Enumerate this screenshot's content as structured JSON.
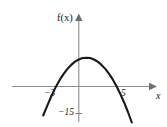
{
  "figure": {
    "background_color": "#ffffff",
    "curve_color": "#1a1a1a",
    "axis_color": "#8d8d8d",
    "text_color": "#161616",
    "width": 167,
    "height": 127
  },
  "labels": {
    "y_axis_label": "f(x)",
    "x_axis_label": "x",
    "tick_left": "−3",
    "tick_right": "5",
    "tick_minimum": "−15"
  },
  "chart_data": {
    "type": "line",
    "title": "",
    "subtitle": "",
    "xlabel": "x",
    "ylabel": "f(x)",
    "grid": false,
    "legend": null,
    "legend_position": "none",
    "axis_arrows": {
      "x_right": true,
      "x_left": false,
      "y_top": true,
      "y_bottom": false
    },
    "xlim": [
      -6.2,
      8.4
    ],
    "ylim": [
      -19.5,
      22.0
    ],
    "xticks": [
      -3,
      5
    ],
    "xticklabels": [
      "−3",
      "5"
    ],
    "yticks": [
      -15
    ],
    "yticklabels": [
      "−15"
    ],
    "annotations": [
      {
        "text": "f(x)",
        "x": -0.9,
        "y": 21.0,
        "role": "y-axis-label"
      },
      {
        "text": "x",
        "x": 8.0,
        "y": -2.2,
        "role": "x-axis-label"
      },
      {
        "text": "−3",
        "x": -3.0,
        "y": -2.6,
        "role": "x-intercept-label"
      },
      {
        "text": "5",
        "x": 5.0,
        "y": -2.6,
        "role": "x-intercept-label"
      },
      {
        "text": "−15",
        "x": -0.6,
        "y": -15.0,
        "role": "minimum-label"
      }
    ],
    "series": [
      {
        "name": "f(x) = x² − 2x − 15",
        "shape": "parabola",
        "roots": [
          -3,
          5
        ],
        "vertex": [
          1,
          -16
        ],
        "opens": "up",
        "x": [
          -4.7,
          -4.2,
          -3.7,
          -3.2,
          -3.0,
          -2.5,
          -2.0,
          -1.5,
          -1.0,
          -0.5,
          0.0,
          0.5,
          1.0,
          1.5,
          2.0,
          2.5,
          3.0,
          3.5,
          4.0,
          4.5,
          5.0,
          5.5,
          6.0,
          6.5,
          7.0
        ],
        "values": [
          16.1,
          11.0,
          6.1,
          1.6,
          0.0,
          -3.8,
          -7.0,
          -9.8,
          -12.0,
          -13.8,
          -15.0,
          -15.8,
          -16.0,
          -15.8,
          -15.0,
          -13.8,
          -12.0,
          -9.8,
          -7.0,
          -3.8,
          0.0,
          4.3,
          9.0,
          14.3,
          20.0
        ]
      }
    ]
  }
}
